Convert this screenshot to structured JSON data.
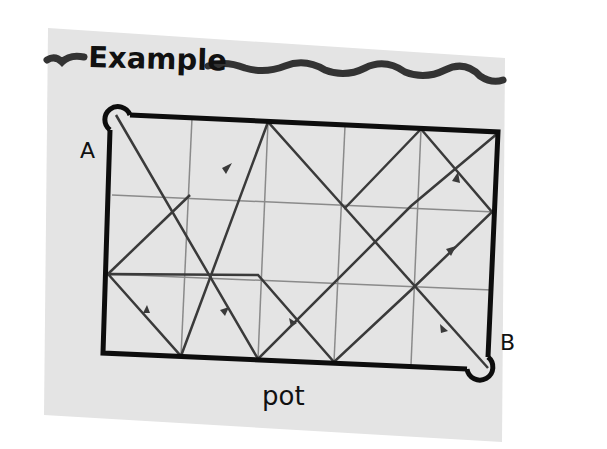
{
  "heading": "Example",
  "labels": {
    "start": "A",
    "end": "B",
    "bottom": "pot"
  },
  "grid": {
    "columns": 5,
    "rows": 3
  },
  "colors": {
    "paper": "#e4e4e4",
    "border": "#0d0d0d",
    "gridline": "#8a8a8a",
    "path": "#3a3a3a"
  }
}
